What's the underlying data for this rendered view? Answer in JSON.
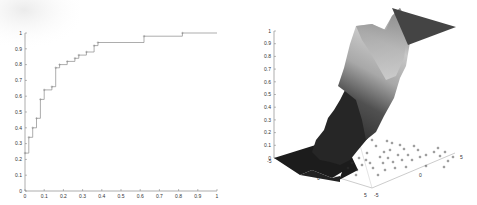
{
  "chart_data": [
    {
      "type": "line",
      "subtype": "step",
      "title": "",
      "xlabel": "",
      "ylabel": "",
      "xlim": [
        0,
        1
      ],
      "ylim": [
        0,
        1
      ],
      "grid": false,
      "legend": null,
      "xticks": [
        "0",
        "0.1",
        "0.2",
        "0.3",
        "0.4",
        "0.5",
        "0.6",
        "0.7",
        "0.8",
        "0.9",
        "1"
      ],
      "yticks": [
        "0",
        "0.1",
        "0.2",
        "0.3",
        "0.4",
        "0.5",
        "0.6",
        "0.7",
        "0.8",
        "0.9",
        "1"
      ],
      "series": [
        {
          "name": "ROC curve",
          "color": "#8a8a8a",
          "marker": "+",
          "x": [
            0,
            0.02,
            0.02,
            0.04,
            0.04,
            0.06,
            0.06,
            0.08,
            0.08,
            0.1,
            0.1,
            0.14,
            0.14,
            0.16,
            0.16,
            0.18,
            0.18,
            0.22,
            0.22,
            0.26,
            0.26,
            0.28,
            0.28,
            0.32,
            0.32,
            0.36,
            0.36,
            0.38,
            0.38,
            0.62,
            0.62,
            0.82,
            0.82,
            1.0
          ],
          "y": [
            0.24,
            0.24,
            0.34,
            0.34,
            0.4,
            0.4,
            0.46,
            0.46,
            0.58,
            0.58,
            0.64,
            0.64,
            0.66,
            0.66,
            0.78,
            0.78,
            0.8,
            0.8,
            0.82,
            0.82,
            0.84,
            0.84,
            0.86,
            0.86,
            0.88,
            0.88,
            0.92,
            0.92,
            0.94,
            0.94,
            0.98,
            0.98,
            1.0,
            1.0
          ]
        }
      ]
    },
    {
      "type": "surface3d",
      "title": "",
      "xlabel": "",
      "ylabel": "",
      "zlabel": "",
      "xlim": [
        -5,
        5
      ],
      "ylim": [
        -5,
        5
      ],
      "zlim": [
        0,
        1
      ],
      "grid": false,
      "zticks": [
        "0",
        "0.1",
        "0.2",
        "0.3",
        "0.4",
        "0.5",
        "0.6",
        "0.7",
        "0.8",
        "0.9",
        "1"
      ],
      "xticks": [
        "-5",
        "0",
        "5"
      ],
      "yticks": [
        "-5",
        "0",
        "5"
      ],
      "description": "Sigmoid-like step surface rising from 0 to 1 across the plane, shaded dark at low and high plateaus with grayscale ramp; scatter '+' markers on z=0 plane",
      "scatter_marker": "+",
      "scatter_count_approx": 45
    }
  ]
}
